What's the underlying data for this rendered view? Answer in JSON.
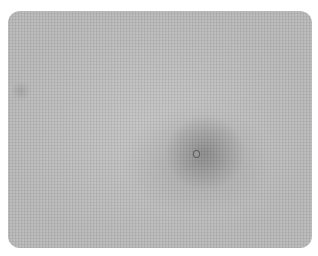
{
  "image": {
    "description": "Grayscale textured photograph with a darker diffuse region and a small ring-shaped spot near center-right",
    "colors": {
      "background": "#b9b9b9",
      "dark_region": "#8a8a8a",
      "spot_outline": "#5c5c5c"
    }
  }
}
